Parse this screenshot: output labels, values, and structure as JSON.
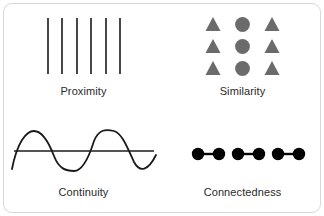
{
  "figure": {
    "background_color": "#ffffff",
    "card_border_color": "#d8d8d8",
    "panels": [
      {
        "id": "proximity",
        "label": "Proximity",
        "art": "six-vertical-lines-in-three-pairs",
        "stroke_color": "#1a1a1a",
        "element_count": 6,
        "group_count": 3
      },
      {
        "id": "similarity",
        "label": "Similarity",
        "art": "three-by-three-grid-triangles-and-circles",
        "shape_color": "#6b6b6b",
        "rows": 3,
        "columns": 3,
        "column_shapes": [
          "triangle",
          "circle",
          "triangle"
        ],
        "element_count": 9
      },
      {
        "id": "continuity",
        "label": "Continuity",
        "art": "sine-wave-crossing-straight-line",
        "wave_color": "#1a1a1a",
        "line_color": "#555555",
        "wave_cycles": 3.5
      },
      {
        "id": "connectedness",
        "label": "Connectedness",
        "art": "six-dots-joined-into-three-connected-pairs",
        "dot_color": "#000000",
        "connector_color": "#000000",
        "dot_count": 6,
        "pair_count": 3
      }
    ]
  }
}
